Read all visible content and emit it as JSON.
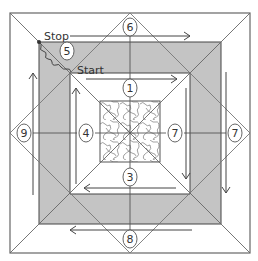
{
  "diagram": {
    "colors": {
      "line": "#555555",
      "band": "#c4c4c4",
      "background": "#ffffff",
      "text": "#333333"
    },
    "labels": {
      "start": "Start",
      "stop": "Stop"
    },
    "markers": [
      {
        "id": "m1",
        "text": "1",
        "x": 130,
        "y": 88
      },
      {
        "id": "m3",
        "text": "3",
        "x": 130,
        "y": 177
      },
      {
        "id": "m4",
        "text": "4",
        "x": 86,
        "y": 133
      },
      {
        "id": "m7a",
        "text": "7",
        "x": 175,
        "y": 133
      },
      {
        "id": "m5",
        "text": "5",
        "x": 67,
        "y": 51
      },
      {
        "id": "m6",
        "text": "6",
        "x": 130,
        "y": 27
      },
      {
        "id": "m7b",
        "text": "7",
        "x": 235,
        "y": 133
      },
      {
        "id": "m8",
        "text": "8",
        "x": 130,
        "y": 239
      },
      {
        "id": "m9",
        "text": "9",
        "x": 24,
        "y": 133
      }
    ]
  }
}
